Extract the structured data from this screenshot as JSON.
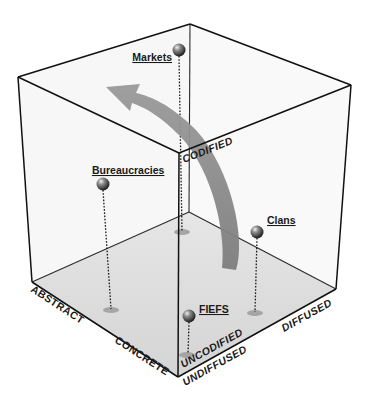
{
  "diagram": {
    "type": "3d-cube-space",
    "axes": {
      "codification": {
        "high": "CODIFIED",
        "low": "UNCODIFIED"
      },
      "abstraction": {
        "high": "ABSTRACT",
        "low": "CONCRETE"
      },
      "diffusion": {
        "high": "DIFFUSED",
        "low": "UNDIFFUSED"
      }
    },
    "nodes": [
      {
        "id": "markets",
        "label": "Markets"
      },
      {
        "id": "bureaucracies",
        "label": "Bureaucracies"
      },
      {
        "id": "clans",
        "label": "Clans"
      },
      {
        "id": "fiefs",
        "label": "FIEFS"
      }
    ],
    "arrow": {
      "description": "curved arrow from lower right toward upper left"
    },
    "colors": {
      "edge": "#1a1a1a",
      "floor": "#dcdcdc",
      "arrow": "#8a8a8a",
      "sphere": "#555555",
      "shadow": "#9a9a9a"
    }
  }
}
